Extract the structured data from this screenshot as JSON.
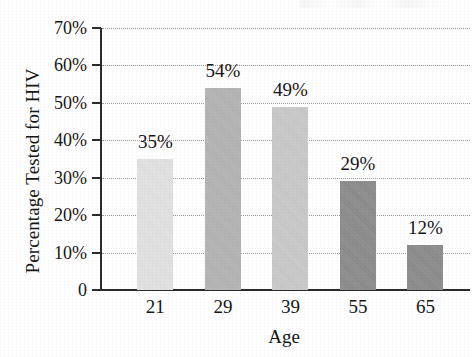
{
  "chart_data": {
    "type": "bar",
    "title": "",
    "xlabel": "Age",
    "ylabel": "Percentage Tested for HIV",
    "categories": [
      "21",
      "29",
      "39",
      "55",
      "65"
    ],
    "values": [
      35,
      54,
      49,
      29,
      12
    ],
    "value_labels": [
      "35%",
      "54%",
      "49%",
      "29%",
      "12%"
    ],
    "ylim": [
      0,
      70
    ],
    "ytick_values": [
      0,
      10,
      20,
      30,
      40,
      50,
      60,
      70
    ],
    "ytick_labels": [
      "0",
      "10%",
      "20%",
      "30%",
      "40%",
      "50%",
      "60%",
      "70%"
    ],
    "bar_colors": [
      "#e2e2e2",
      "#b4b4b4",
      "#c9c9c9",
      "#8d8d8d",
      "#8d8d8d"
    ],
    "grid": "horizontal-dotted",
    "legend": "none",
    "axis_color": "#2b2b2b",
    "gridline_color": "#9a9a9a",
    "background": "#ffffff"
  },
  "axes": {
    "y_title": "Percentage Tested for HIV",
    "x_title": "Age"
  }
}
